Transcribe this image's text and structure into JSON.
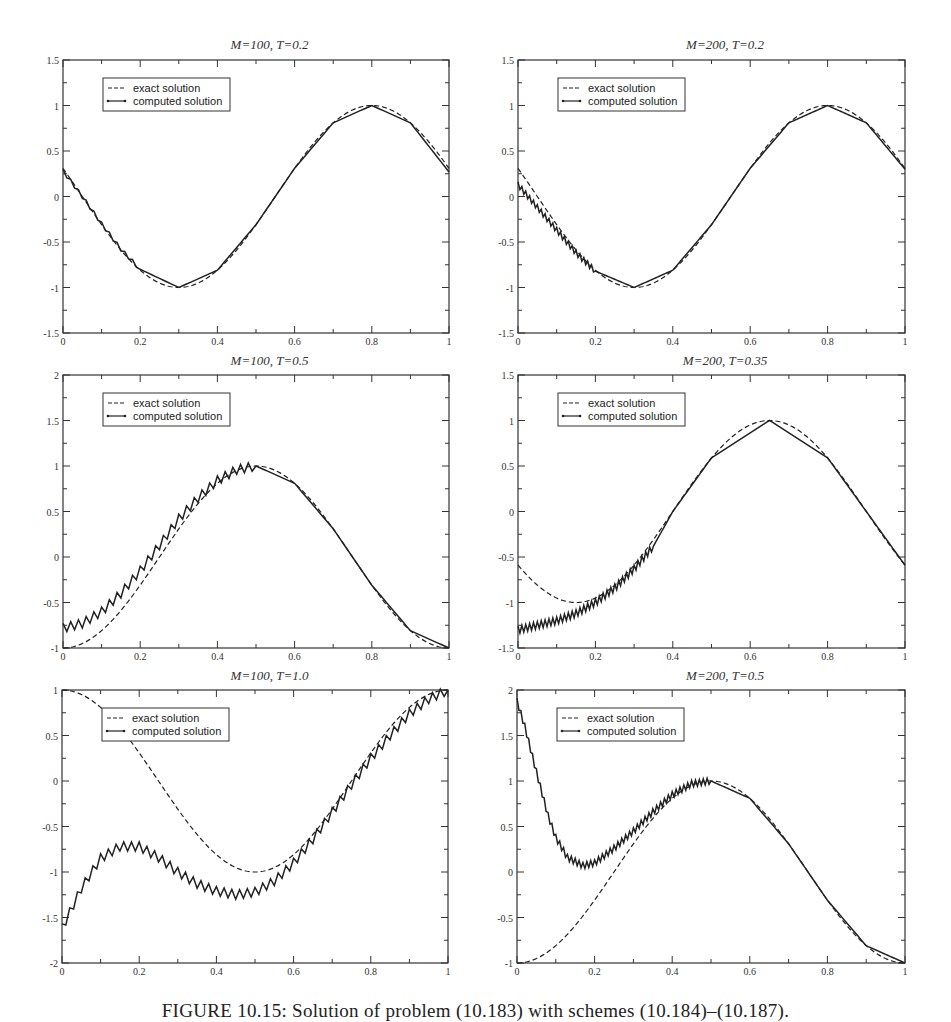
{
  "figure": {
    "caption": "FIGURE 10.15: Solution of problem (10.183) with schemes (10.184)–(10.187)."
  },
  "legend": {
    "exact_label": "exact solution",
    "computed_label": "computed solution"
  },
  "style": {
    "line_color": "#222222",
    "axis_color": "#333333"
  },
  "chart_data": [
    {
      "type": "line",
      "title": "M=100, T=0.2",
      "xlabel": "",
      "ylabel": "",
      "xlim": [
        0,
        1
      ],
      "ylim": [
        -1.5,
        1.5
      ],
      "xticks": [
        0,
        0.2,
        0.4,
        0.6,
        0.8,
        1
      ],
      "yticks": [
        -1.5,
        -1,
        -0.5,
        0,
        0.5,
        1,
        1.5
      ],
      "grid": false,
      "legend_position": "upper-left",
      "T": 0.2,
      "M": 100,
      "series": [
        {
          "name": "exact solution",
          "formula": "sin(2*pi*(x - 0.75 + T))",
          "style": "dashed"
        },
        {
          "name": "computed solution",
          "style": "solid-with-markers",
          "x": [
            0,
            0.05,
            0.1,
            0.15,
            0.2,
            0.3,
            0.4,
            0.5,
            0.6,
            0.7,
            0.8,
            0.9,
            1.0
          ],
          "y": [
            0.28,
            0.0,
            -0.3,
            -0.58,
            -0.8,
            -1.0,
            -0.81,
            -0.31,
            0.31,
            0.81,
            1.0,
            0.81,
            0.27
          ],
          "oscillation_until_x": 0.2,
          "oscillation_amp": 0.02
        }
      ]
    },
    {
      "type": "line",
      "title": "M=200, T=0.2",
      "xlabel": "",
      "ylabel": "",
      "xlim": [
        0,
        1
      ],
      "ylim": [
        -1.5,
        1.5
      ],
      "xticks": [
        0,
        0.2,
        0.4,
        0.6,
        0.8,
        1
      ],
      "yticks": [
        -1.5,
        -1,
        -0.5,
        0,
        0.5,
        1,
        1.5
      ],
      "grid": false,
      "legend_position": "upper-left",
      "T": 0.2,
      "M": 200,
      "series": [
        {
          "name": "exact solution",
          "formula": "sin(2*pi*(x - 0.75 + T))",
          "style": "dashed"
        },
        {
          "name": "computed solution",
          "style": "solid-with-markers",
          "x": [
            0,
            0.05,
            0.1,
            0.15,
            0.2,
            0.3,
            0.4,
            0.5,
            0.6,
            0.7,
            0.8,
            0.9,
            1.0
          ],
          "y": [
            0.13,
            -0.12,
            -0.37,
            -0.62,
            -0.82,
            -1.0,
            -0.81,
            -0.31,
            0.31,
            0.81,
            1.0,
            0.81,
            0.3
          ],
          "oscillation_until_x": 0.2,
          "oscillation_amp": 0.03
        }
      ]
    },
    {
      "type": "line",
      "title": "M=100, T=0.5",
      "xlabel": "",
      "ylabel": "",
      "xlim": [
        0,
        1
      ],
      "ylim": [
        -1,
        2
      ],
      "xticks": [
        0,
        0.2,
        0.4,
        0.6,
        0.8,
        1
      ],
      "yticks": [
        -1,
        -0.5,
        0,
        0.5,
        1,
        1.5,
        2
      ],
      "grid": false,
      "legend_position": "upper-left",
      "T": 0.5,
      "M": 100,
      "series": [
        {
          "name": "exact solution",
          "formula": "sin(2*pi*(x - 0.75 + T))",
          "style": "dashed"
        },
        {
          "name": "computed solution",
          "style": "solid-with-markers",
          "x": [
            0,
            0.05,
            0.1,
            0.15,
            0.2,
            0.25,
            0.3,
            0.35,
            0.4,
            0.45,
            0.5,
            0.6,
            0.7,
            0.8,
            0.9,
            1.0
          ],
          "y": [
            -0.78,
            -0.73,
            -0.6,
            -0.4,
            -0.15,
            0.13,
            0.42,
            0.65,
            0.84,
            0.96,
            1.0,
            0.81,
            0.31,
            -0.31,
            -0.81,
            -1.0
          ],
          "oscillation_until_x": 0.5,
          "oscillation_amp": 0.05
        }
      ]
    },
    {
      "type": "line",
      "title": "M=200, T=0.35",
      "xlabel": "",
      "ylabel": "",
      "xlim": [
        0,
        1
      ],
      "ylim": [
        -1.5,
        1.5
      ],
      "xticks": [
        0,
        0.2,
        0.4,
        0.6,
        0.8,
        1
      ],
      "yticks": [
        -1.5,
        -1,
        -0.5,
        0,
        0.5,
        1,
        1.5
      ],
      "grid": false,
      "legend_position": "upper-left",
      "T": 0.35,
      "M": 200,
      "series": [
        {
          "name": "exact solution",
          "formula": "sin(2*pi*(x - 0.75 + T))",
          "style": "dashed"
        },
        {
          "name": "computed solution",
          "style": "solid-with-markers",
          "x": [
            0,
            0.05,
            0.1,
            0.15,
            0.2,
            0.25,
            0.3,
            0.35,
            0.4,
            0.5,
            0.65,
            0.8,
            0.9,
            1.0
          ],
          "y": [
            -1.3,
            -1.25,
            -1.2,
            -1.12,
            -1.0,
            -0.84,
            -0.63,
            -0.38,
            -0.0,
            0.59,
            1.0,
            0.59,
            0.0,
            -0.59
          ],
          "oscillation_until_x": 0.35,
          "oscillation_amp": 0.04
        }
      ]
    },
    {
      "type": "line",
      "title": "M=100, T=1.0",
      "xlabel": "",
      "ylabel": "",
      "xlim": [
        0,
        1
      ],
      "ylim": [
        -2,
        1
      ],
      "xticks": [
        0,
        0.2,
        0.4,
        0.6,
        0.8,
        1
      ],
      "yticks": [
        -2,
        -1.5,
        -1,
        -0.5,
        0,
        0.5,
        1
      ],
      "grid": false,
      "legend_position": "upper-left",
      "T": 1.0,
      "M": 100,
      "series": [
        {
          "name": "exact solution",
          "formula": "sin(2*pi*(x - 0.75 + T))",
          "style": "dashed"
        },
        {
          "name": "computed solution",
          "style": "solid-with-markers",
          "x": [
            0,
            0.05,
            0.1,
            0.15,
            0.2,
            0.25,
            0.3,
            0.35,
            0.4,
            0.45,
            0.5,
            0.55,
            0.6,
            0.65,
            0.7,
            0.75,
            0.8,
            0.85,
            0.9,
            0.95,
            1.0
          ],
          "y": [
            -1.62,
            -1.18,
            -0.85,
            -0.72,
            -0.72,
            -0.84,
            -1.0,
            -1.13,
            -1.21,
            -1.25,
            -1.22,
            -1.1,
            -0.9,
            -0.64,
            -0.34,
            -0.04,
            0.25,
            0.5,
            0.74,
            0.9,
            1.0
          ],
          "oscillation_until_x": 1.0,
          "oscillation_amp": 0.05
        }
      ]
    },
    {
      "type": "line",
      "title": "M=200, T=0.5",
      "xlabel": "",
      "ylabel": "",
      "xlim": [
        0,
        1
      ],
      "ylim": [
        -1,
        2
      ],
      "xticks": [
        0,
        0.2,
        0.4,
        0.6,
        0.8,
        1
      ],
      "yticks": [
        -1,
        -0.5,
        0,
        0.5,
        1,
        1.5,
        2
      ],
      "grid": false,
      "legend_position": "upper-left",
      "T": 0.5,
      "M": 200,
      "series": [
        {
          "name": "exact solution",
          "formula": "sin(2*pi*(x - 0.75 + T))",
          "style": "dashed"
        },
        {
          "name": "computed solution",
          "style": "solid-with-markers",
          "x": [
            0,
            0.02,
            0.05,
            0.08,
            0.1,
            0.13,
            0.17,
            0.2,
            0.25,
            0.3,
            0.35,
            0.4,
            0.45,
            0.5,
            0.6,
            0.7,
            0.8,
            0.9,
            1.0
          ],
          "y": [
            1.88,
            1.6,
            1.1,
            0.62,
            0.38,
            0.16,
            0.07,
            0.1,
            0.26,
            0.45,
            0.66,
            0.85,
            0.97,
            1.0,
            0.81,
            0.31,
            -0.31,
            -0.81,
            -1.0
          ],
          "oscillation_until_x": 0.5,
          "oscillation_amp": 0.035
        }
      ]
    }
  ]
}
